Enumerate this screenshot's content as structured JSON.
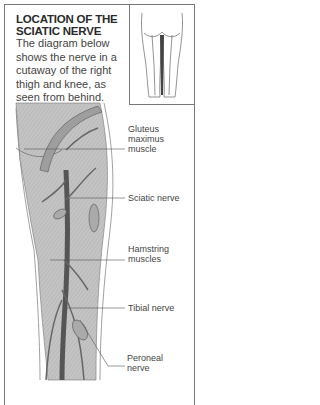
{
  "header": {
    "title_line1": "LOCATION OF THE",
    "title_line2": "SCIATIC NERVE",
    "description": "The diagram below shows the nerve in a cutaway of the right thigh and knee, as seen from behind."
  },
  "inset": {
    "icon": "legs-rear-view-icon"
  },
  "labels": {
    "gluteus_1": "Gluteus",
    "gluteus_2": "maximus",
    "gluteus_3": "muscle",
    "sciatic": "Sciatic nerve",
    "hamstring_1": "Hamstring",
    "hamstring_2": "muscles",
    "tibial": "Tibial nerve",
    "peroneal_1": "Peroneal",
    "peroneal_2": "nerve"
  },
  "colors": {
    "muscle_fill": "#bdbdbd",
    "nerve": "#555555",
    "outline": "#777777"
  }
}
